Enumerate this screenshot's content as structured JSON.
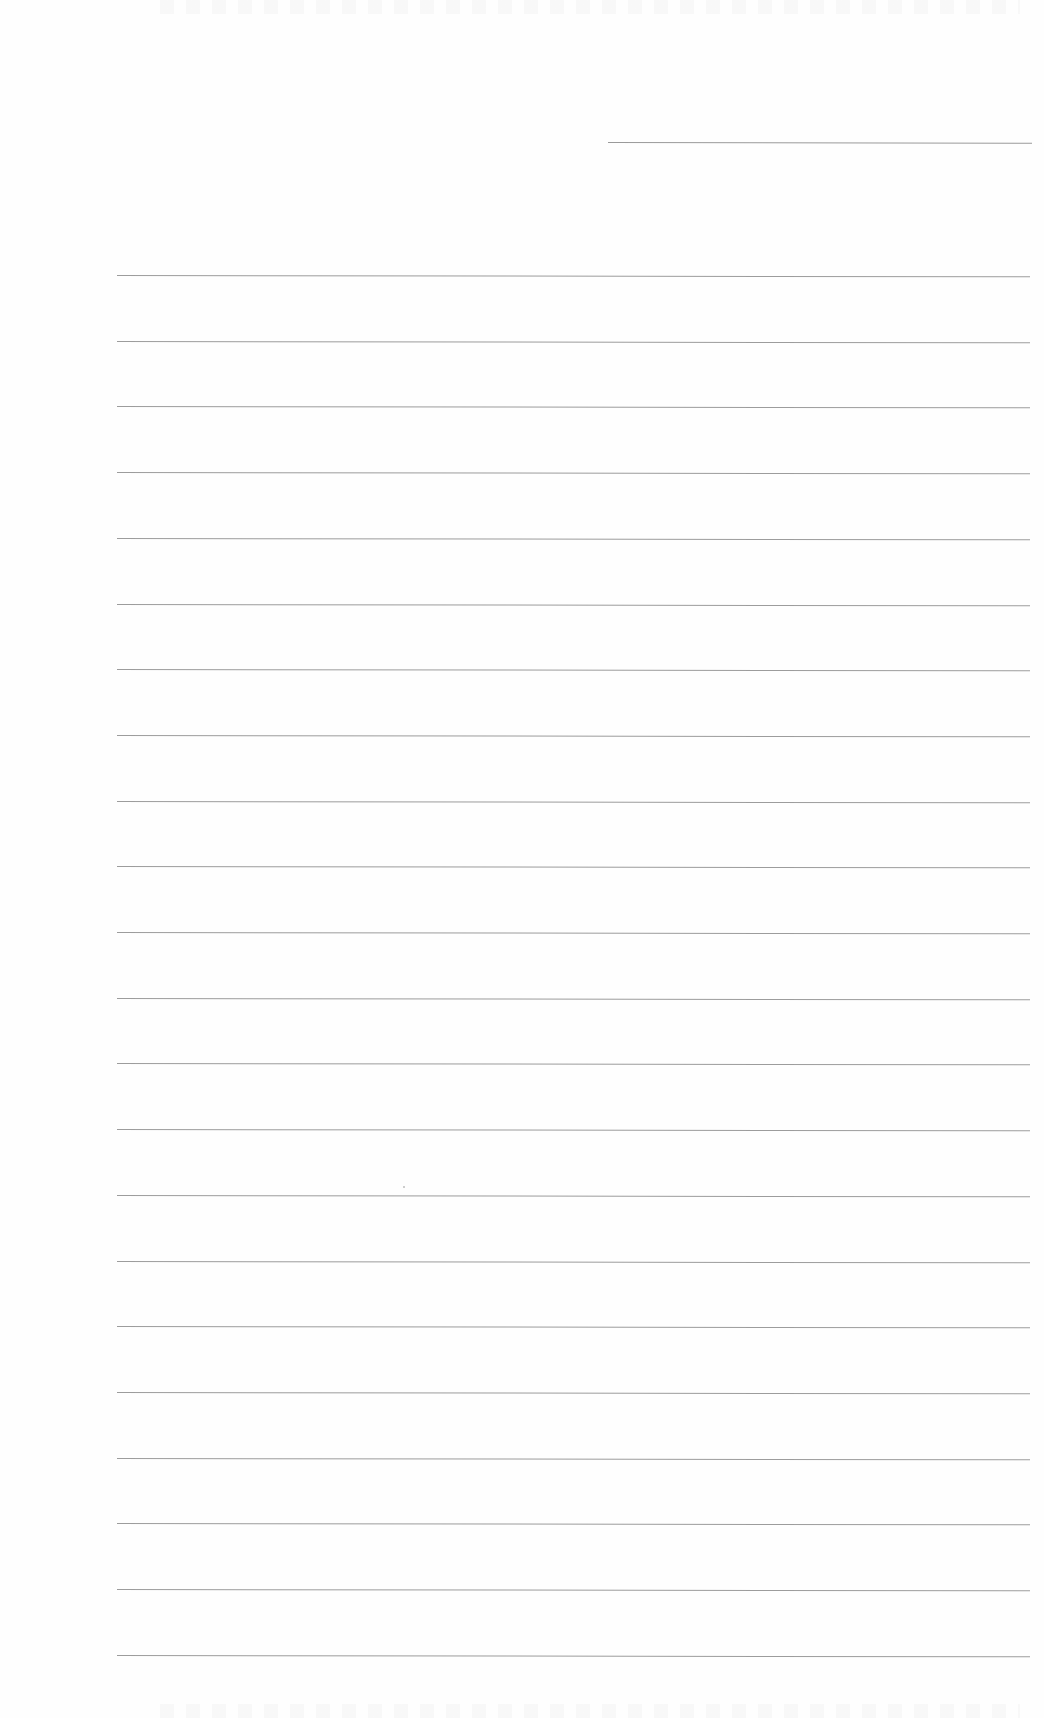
{
  "page": {
    "type": "lined-paper",
    "background_color": "#fefefe",
    "rule_color": "#9c9c9c",
    "header_line": {
      "left": 608,
      "top": 142,
      "width": 424
    },
    "rules": {
      "left": 117,
      "width": 913,
      "first_top": 275,
      "spacing": 65.7,
      "count": 22
    }
  }
}
